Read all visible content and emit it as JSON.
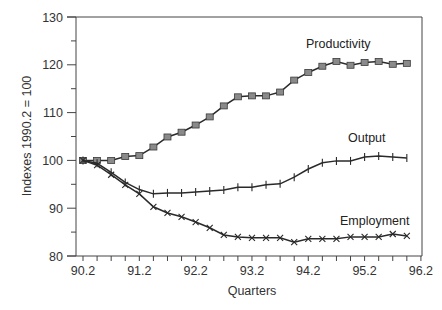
{
  "chart_data": {
    "type": "line",
    "title": "",
    "xlabel": "Quarters",
    "ylabel": "Indexes 1990.2 = 100",
    "ylim": [
      80,
      130
    ],
    "yticks": [
      80,
      90,
      100,
      110,
      120,
      130
    ],
    "xtick_labels": [
      "90.2",
      "91.2",
      "92.2",
      "93.2",
      "94.2",
      "95.2",
      "96.2"
    ],
    "grid": false,
    "legend": "inline labels",
    "x": [
      "90.2",
      "90.3",
      "90.4",
      "91.1",
      "91.2",
      "91.3",
      "91.4",
      "92.1",
      "92.2",
      "92.3",
      "92.4",
      "93.1",
      "93.2",
      "93.3",
      "93.4",
      "94.1",
      "94.2",
      "94.3",
      "94.4",
      "95.1",
      "95.2",
      "95.3",
      "95.4",
      "96.1"
    ],
    "series": [
      {
        "name": "Productivity",
        "marker": "square",
        "values": [
          100.0,
          100.0,
          100.0,
          100.8,
          101.0,
          102.8,
          104.9,
          105.9,
          107.4,
          109.1,
          111.4,
          113.3,
          113.5,
          113.5,
          114.3,
          116.8,
          118.4,
          119.7,
          120.7,
          119.9,
          120.5,
          120.7,
          120.1,
          120.3
        ]
      },
      {
        "name": "Output",
        "marker": "plus",
        "values": [
          100.0,
          99.4,
          97.5,
          95.4,
          93.9,
          93.0,
          93.2,
          93.2,
          93.4,
          93.6,
          93.8,
          94.4,
          94.4,
          94.9,
          95.1,
          96.5,
          98.2,
          99.5,
          99.9,
          99.9,
          100.7,
          100.9,
          100.7,
          100.5
        ]
      },
      {
        "name": "Employment",
        "marker": "x",
        "values": [
          100.0,
          99.0,
          97.0,
          94.9,
          93.0,
          90.3,
          89.0,
          88.2,
          87.1,
          85.9,
          84.4,
          84.0,
          83.8,
          83.8,
          83.8,
          82.9,
          83.6,
          83.6,
          83.6,
          84.0,
          84.0,
          84.0,
          84.6,
          84.2
        ]
      }
    ]
  },
  "labels": {
    "productivity": "Productivity",
    "output": "Output",
    "employment": "Employment"
  },
  "colors": {
    "line": "#2a2a2a",
    "square_marker_fill": "#8a8a8a",
    "axis": "#444444"
  }
}
